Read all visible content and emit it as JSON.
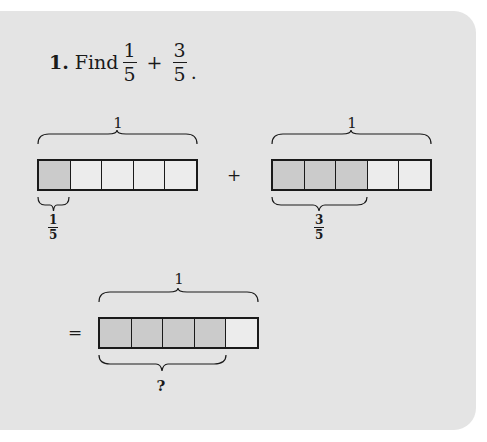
{
  "problem": {
    "number": "1.",
    "verb": "Find",
    "expression": {
      "a": {
        "numerator": "1",
        "denominator": "5"
      },
      "operator": "+",
      "b": {
        "numerator": "3",
        "denominator": "5"
      },
      "end": "."
    }
  },
  "models": {
    "first": {
      "whole_label": "1",
      "parts": 5,
      "shaded": 1,
      "part_label": {
        "numerator": "1",
        "denominator": "5"
      }
    },
    "plus_sign": "+",
    "second": {
      "whole_label": "1",
      "parts": 5,
      "shaded": 3,
      "part_label": {
        "numerator": "3",
        "denominator": "5"
      }
    },
    "equals_sign": "=",
    "result": {
      "whole_label": "1",
      "parts": 5,
      "shaded": 4,
      "part_label": "?"
    }
  },
  "colors": {
    "panel": "#e4e4e4",
    "shaded_cell": "#cbcbcb",
    "unshaded_cell": "#ececec",
    "ink": "#1a1a1a"
  }
}
